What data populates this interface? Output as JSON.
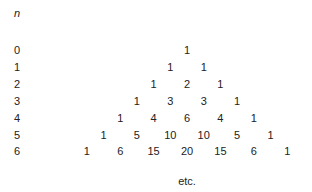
{
  "header": {
    "n_label": "n"
  },
  "rows": [
    {
      "n": "0",
      "values": [
        "1"
      ]
    },
    {
      "n": "1",
      "values": [
        "1",
        "1"
      ]
    },
    {
      "n": "2",
      "values": [
        "1",
        "2",
        "1"
      ]
    },
    {
      "n": "3",
      "values": [
        "1",
        "3",
        "3",
        "1"
      ]
    },
    {
      "n": "4",
      "values": [
        "1",
        "4",
        "6",
        "4",
        "1"
      ]
    },
    {
      "n": "5",
      "values": [
        "1",
        "5",
        "10",
        "10",
        "5",
        "1"
      ]
    },
    {
      "n": "6",
      "values": [
        "1",
        "6",
        "15",
        "20",
        "15",
        "6",
        "1"
      ]
    }
  ],
  "footer": {
    "etc": "etc."
  }
}
